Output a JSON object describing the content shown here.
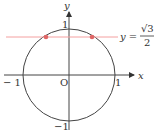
{
  "diagram": {
    "type": "unit-circle",
    "axes": {
      "x_label": "x",
      "y_label": "y",
      "origin_label": "O"
    },
    "ticks": {
      "x_neg": "− 1",
      "x_pos": "1",
      "y_pos": "1",
      "y_neg": "−1"
    },
    "line": {
      "equation_lhs": "y =",
      "numerator": "√3",
      "denominator": "2",
      "color": "#f08080"
    },
    "points_color": "#e06666",
    "circle_color": "#444444"
  }
}
